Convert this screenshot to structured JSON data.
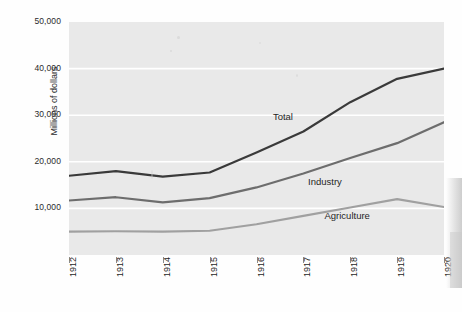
{
  "chart_data": {
    "type": "line",
    "title": "",
    "xlabel": "",
    "ylabel": "Millions of dollars",
    "x": [
      1912,
      1913,
      1914,
      1915,
      1916,
      1917,
      1918,
      1919,
      1920
    ],
    "categories": [
      "1912",
      "1913",
      "1914",
      "1915",
      "1916",
      "1917",
      "1918",
      "1919",
      "1920"
    ],
    "ylim": [
      0,
      50000
    ],
    "xlim": [
      1912,
      1920
    ],
    "yticks": [
      10000,
      20000,
      30000,
      40000,
      50000
    ],
    "ytick_labels": [
      "10,000",
      "20,000",
      "30,000",
      "40,000",
      "50,000"
    ],
    "grid": true,
    "legend_position": "inline-labels",
    "series": [
      {
        "name": "Total",
        "color": "#3a3a3a",
        "values": [
          17000,
          18000,
          16800,
          17700,
          22000,
          26500,
          32800,
          37800,
          40000
        ],
        "label_x": 1916.35,
        "label_y": 29600
      },
      {
        "name": "Industry",
        "color": "#6d6d6d",
        "values": [
          11700,
          12400,
          11300,
          12200,
          14500,
          17500,
          20800,
          24000,
          28500
        ],
        "label_x": 1917.1,
        "label_y": 15600
      },
      {
        "name": "Agriculture",
        "color": "#a0a0a0",
        "values": [
          5000,
          5100,
          5000,
          5200,
          6600,
          8400,
          10200,
          12000,
          10300
        ],
        "label_x": 1917.45,
        "label_y": 8300
      }
    ]
  },
  "axes": {
    "y_title": "Millions of dollars"
  },
  "colors": {
    "plot_background": "#e9e9e9",
    "gridline": "#ffffff",
    "page_background": "#fefefe",
    "tick_text": "#1f1f1f"
  }
}
